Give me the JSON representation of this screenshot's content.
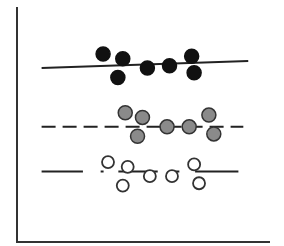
{
  "chart_data": {
    "type": "scatter",
    "title": "",
    "xlabel": "",
    "ylabel": "",
    "xlim": [
      0,
      10
    ],
    "ylim": [
      0,
      10
    ],
    "grid": false,
    "legend": "none",
    "series": [
      {
        "name": "black",
        "marker": "filled-black",
        "fill": "#111111",
        "line_style": "solid",
        "fit_line": {
          "x": [
            1.0,
            9.4
          ],
          "y": [
            7.4,
            7.7
          ]
        },
        "points": [
          {
            "x": 3.5,
            "y": 8.0
          },
          {
            "x": 4.3,
            "y": 7.8
          },
          {
            "x": 4.1,
            "y": 7.0
          },
          {
            "x": 5.3,
            "y": 7.4
          },
          {
            "x": 6.2,
            "y": 7.5
          },
          {
            "x": 7.1,
            "y": 7.9
          },
          {
            "x": 7.2,
            "y": 7.2
          }
        ]
      },
      {
        "name": "gray",
        "marker": "filled-gray",
        "fill": "#8a8a8a",
        "line_style": "dashed",
        "fit_line": {
          "x": [
            1.0,
            9.2
          ],
          "y": [
            4.9,
            4.9
          ]
        },
        "points": [
          {
            "x": 4.4,
            "y": 5.5
          },
          {
            "x": 5.1,
            "y": 5.3
          },
          {
            "x": 4.9,
            "y": 4.5
          },
          {
            "x": 6.1,
            "y": 4.9
          },
          {
            "x": 7.0,
            "y": 4.9
          },
          {
            "x": 7.8,
            "y": 5.4
          },
          {
            "x": 8.0,
            "y": 4.6
          }
        ]
      },
      {
        "name": "open",
        "marker": "open-circle",
        "fill": "#ffffff",
        "line_style": "broken-solid",
        "fit_line": {
          "x": [
            1.0,
            9.0
          ],
          "y": [
            3.0,
            3.0
          ]
        },
        "points": [
          {
            "x": 3.7,
            "y": 3.4
          },
          {
            "x": 4.5,
            "y": 3.2
          },
          {
            "x": 4.3,
            "y": 2.4
          },
          {
            "x": 5.4,
            "y": 2.8
          },
          {
            "x": 6.3,
            "y": 2.8
          },
          {
            "x": 7.2,
            "y": 3.3
          },
          {
            "x": 7.4,
            "y": 2.5
          }
        ]
      }
    ]
  }
}
